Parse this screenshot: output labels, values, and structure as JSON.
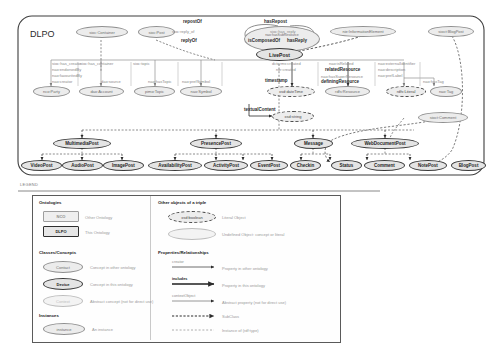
{
  "diagram": {
    "container_label": "DLPO",
    "legend_caption": "LEGEND"
  },
  "nodes": {
    "sioc_container": "sioc:Container",
    "sioc_post": "sioc:Post",
    "nao_has_sub_resource": "nao:hasSubResource",
    "nie_information_element": "nie:InformationElement",
    "sioct_blogpost": "sioct:BlogPost",
    "livepost": "LivePost",
    "nco_party": "nco:Party",
    "dao_account": "dao:Account",
    "pimo_topic": "pimo:Topic",
    "nao_symbol": "nao:Symbol",
    "xsd_datetime": "xsd:dateTime",
    "rdfs_resource": "rdfs:Resource",
    "rdfs_literal": "rdfs:Literal",
    "nao_tag": "nao:Tag",
    "xsd_string": "xsd:string",
    "sioct_comment": "sioct:Comment",
    "multimediapost": "MultimediaPost",
    "presencepost": "PresencePost",
    "message": "Message",
    "webdocumentpost": "WebDocumentPost",
    "videopost": "VideoPost",
    "audiopost": "AudioPost",
    "imagepost": "ImagePost",
    "availabilitypost": "AvailabilityPost",
    "activitypost": "ActivityPost",
    "eventpost": "EventPost",
    "checkin": "Checkin",
    "status": "Status",
    "comment": "Comment",
    "notepost": "NotePost",
    "blogpost": "BlogPost"
  },
  "edge_labels": {
    "repost_of": "repostOf",
    "has_repost": "hasRepost",
    "sioc_reply_of": "sioc:reply_of",
    "sioc_has_reply": "sioc:has_reply",
    "reply_of": "replyOf",
    "is_composed_of": "isComposedOf",
    "has_reply": "hasReply",
    "creator_group": [
      "sioc:has_creator",
      "nao:endorsedBy",
      "nao:favouritedBy",
      "nao:creator"
    ],
    "container_group": [
      "sioc:has_container",
      "dao:source"
    ],
    "topic_group": [
      "sioc:topic",
      "nao:hasTopic"
    ],
    "symbol_group": [
      "nao:prefSymbol"
    ],
    "time_group": [
      "dcterms:created",
      "nie:created",
      "timestamp"
    ],
    "resource_group": [
      "nao:isRelated",
      "relatedResource",
      "nao:hasSuperResource",
      "definingResource"
    ],
    "literal_group": [
      "nao:externalIdentifier",
      "nao:description",
      "nao:prefLabel"
    ],
    "tag_group": [
      "nao:hasTag"
    ],
    "textual_content": "textualContent"
  },
  "legend": {
    "sections": {
      "ontologies": "Ontologies",
      "other_objects": "Other objects of a triple",
      "classes": "Classes/Concepts",
      "properties": "Properties/Relationships",
      "instances": "Instances"
    },
    "ontologies": [
      {
        "label": "NCO",
        "desc": "Other Ontology"
      },
      {
        "label": "DLPO",
        "desc": "This Ontology"
      }
    ],
    "other_objects": [
      {
        "label": "xsd:boolean",
        "desc": "Literal Object"
      },
      {
        "label": "",
        "desc": "Undefined Object: concept or literal"
      }
    ],
    "classes": [
      {
        "label": "Contact",
        "desc": "Concept in other ontology"
      },
      {
        "label": "Device",
        "desc": "Concept in this ontology"
      },
      {
        "label": "Context",
        "desc": "Abstract concept (not for direct use)"
      }
    ],
    "properties": [
      {
        "label": "creator",
        "desc": "Property in other ontology"
      },
      {
        "label": "includes",
        "desc": "Property in this ontology"
      },
      {
        "label": "contextObject",
        "desc": "Abstract property (not for direct use)"
      },
      {
        "label": "",
        "desc": "SubClass"
      },
      {
        "label": "",
        "desc": "Instance of (rdf:type)"
      }
    ],
    "instances": [
      {
        "label": "instance",
        "desc": "An instance"
      }
    ]
  },
  "colors": {
    "other_ontology_fill": "#ececec",
    "other_ontology_stroke": "#909090",
    "this_ontology_fill": "#e4e4e4",
    "this_ontology_stroke": "#3a3a3a",
    "literal_stroke": "#4a4a4a",
    "abstract_stroke": "#bdbdbd",
    "edge_grey": "#8f8f8f",
    "edge_dark": "#2b2b2b"
  }
}
